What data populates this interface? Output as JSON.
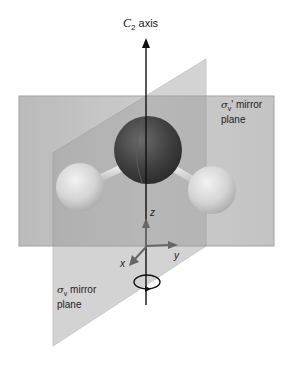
{
  "diagram": {
    "axis_title": {
      "symbol": "C",
      "subscript": "2",
      "text": " axis"
    },
    "back_plane": {
      "sigma": "σ",
      "subscript": "v",
      "prime": "'",
      "line1": " mirror",
      "line2": "plane"
    },
    "front_plane": {
      "sigma": "σ",
      "subscript": "v",
      "line1": " mirror",
      "line2": "plane"
    },
    "axes": {
      "x": "x",
      "y": "y",
      "z": "z"
    },
    "atoms": [
      {
        "name": "O",
        "role": "central-oxygen",
        "color": "#444444"
      },
      {
        "name": "H",
        "role": "hydrogen-left",
        "color": "#d9d9d9"
      },
      {
        "name": "H",
        "role": "hydrogen-right",
        "color": "#d9d9d9"
      }
    ],
    "colors": {
      "back_plane": "#b9b9b9",
      "front_plane": "#a8a8a8",
      "axis": "#111111",
      "coord_arrows": "#666666"
    }
  }
}
